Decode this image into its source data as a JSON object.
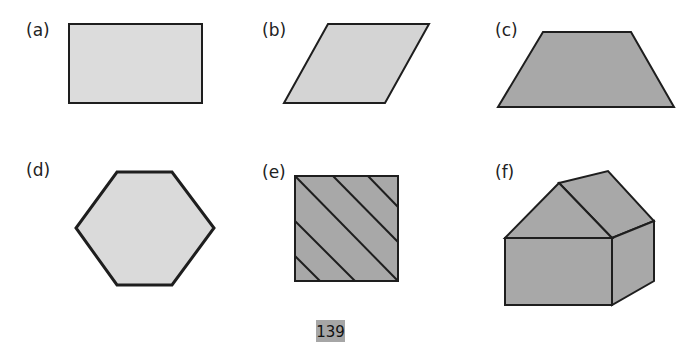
{
  "figures": [
    {
      "label": "(a)",
      "shape": "rectangle",
      "fill": "#dcdcdc"
    },
    {
      "label": "(b)",
      "shape": "parallelogram",
      "fill": "#d4d4d4"
    },
    {
      "label": "(c)",
      "shape": "trapezium",
      "fill": "#a8a8a8"
    },
    {
      "label": "(d)",
      "shape": "hexagon",
      "fill": "#dadada"
    },
    {
      "label": "(e)",
      "shape": "square-with-diagonal-lines",
      "fill": "#a8a8a8"
    },
    {
      "label": "(f)",
      "shape": "house-prism",
      "fill": "#a8a8a8"
    }
  ],
  "page_number": "139",
  "colors": {
    "stroke": "#1e1e1e",
    "page_box": "#a6a6a6"
  }
}
